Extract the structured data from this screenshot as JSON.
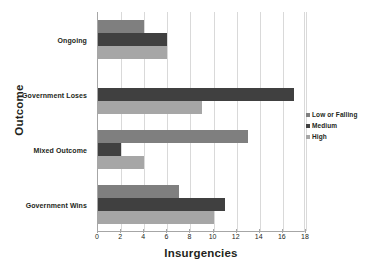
{
  "chart_data": {
    "type": "bar",
    "orientation": "horizontal",
    "title": "",
    "xlabel": "Insurgencies",
    "ylabel": "Outcome",
    "categories": [
      "Ongoing",
      "Government Loses",
      "Mixed Outcome",
      "Government Wins"
    ],
    "series": [
      {
        "name": "Low or Falling",
        "color": "#7f7f7f",
        "values": [
          4,
          0,
          13,
          7
        ]
      },
      {
        "name": "Medium",
        "color": "#404040",
        "values": [
          6,
          17,
          2,
          11
        ]
      },
      {
        "name": "High",
        "color": "#a6a6a6",
        "values": [
          6,
          9,
          4,
          10
        ]
      }
    ],
    "xlim": [
      0,
      18
    ],
    "xticks": [
      0,
      2,
      4,
      6,
      8,
      10,
      12,
      14,
      16,
      18
    ],
    "xtick_labels": [
      "0",
      "2",
      "4",
      "6",
      "8",
      "10",
      "12",
      "14",
      "16",
      "18"
    ],
    "grid": "vertical",
    "legend_position": "right"
  }
}
